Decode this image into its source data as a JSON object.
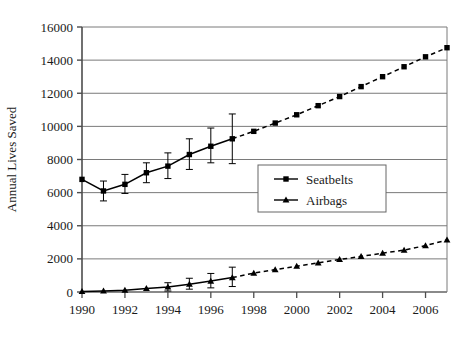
{
  "chart_data": {
    "type": "line",
    "title": "",
    "xlabel": "",
    "ylabel": "Annual Lives Saved",
    "xlim": [
      1990,
      2007
    ],
    "ylim": [
      0,
      16000
    ],
    "grid": true,
    "legend_position": "center-right-inside",
    "x_tick_labels": [
      "1990",
      "1992",
      "1994",
      "1996",
      "1998",
      "2000",
      "2002",
      "2004",
      "2006"
    ],
    "x_tick_values": [
      1990,
      1992,
      1994,
      1996,
      1998,
      2000,
      2002,
      2004,
      2006
    ],
    "y_tick_labels": [
      "0",
      "2000",
      "4000",
      "6000",
      "8000",
      "10000",
      "12000",
      "14000",
      "16000"
    ],
    "y_tick_values": [
      0,
      2000,
      4000,
      6000,
      8000,
      10000,
      12000,
      14000,
      16000
    ],
    "x": [
      1990,
      1991,
      1992,
      1993,
      1994,
      1995,
      1996,
      1997,
      1998,
      1999,
      2000,
      2001,
      2002,
      2003,
      2004,
      2005,
      2006,
      2007
    ],
    "series": [
      {
        "name": "Seatbelts",
        "marker": "square",
        "solid_until": 1997,
        "values": [
          6800,
          6100,
          6500,
          7200,
          7600,
          8300,
          8800,
          9250,
          9700,
          10200,
          10700,
          11250,
          11800,
          12400,
          13000,
          13600,
          14200,
          14750
        ],
        "errors_low": [
          null,
          5500,
          5950,
          6600,
          6850,
          7400,
          7800,
          7750,
          null,
          null,
          null,
          null,
          null,
          null,
          null,
          null,
          null,
          null
        ],
        "errors_high": [
          null,
          6700,
          7100,
          7800,
          8400,
          9250,
          9900,
          10750,
          null,
          null,
          null,
          null,
          null,
          null,
          null,
          null,
          null,
          null
        ]
      },
      {
        "name": "Airbags",
        "marker": "triangle",
        "solid_until": 1997,
        "values": [
          30,
          60,
          110,
          210,
          300,
          470,
          660,
          870,
          1140,
          1350,
          1560,
          1760,
          1960,
          2150,
          2340,
          2530,
          2800,
          3140
        ],
        "errors_low": [
          null,
          null,
          null,
          null,
          60,
          170,
          250,
          330,
          null,
          null,
          null,
          null,
          null,
          null,
          null,
          null,
          null,
          null
        ],
        "errors_high": [
          null,
          null,
          null,
          null,
          560,
          830,
          1120,
          1500,
          null,
          null,
          null,
          null,
          null,
          null,
          null,
          null,
          null,
          null
        ]
      }
    ]
  },
  "legend": {
    "entries": [
      {
        "label": "Seatbelts",
        "marker": "square"
      },
      {
        "label": "Airbags",
        "marker": "triangle"
      }
    ]
  },
  "colors": {
    "line": "#000000",
    "grid": "#7a7a7a",
    "axis": "#4d4d4d",
    "text": "#1a1a1a",
    "background": "#ffffff",
    "legend_border": "#666666"
  }
}
